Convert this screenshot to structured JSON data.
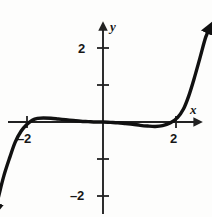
{
  "chart_data": {
    "type": "line",
    "title": "",
    "xlabel": "x",
    "ylabel": "y",
    "xlim": [
      -2.7,
      2.6
    ],
    "ylim": [
      -2.6,
      2.6
    ],
    "grid": false,
    "legend": null,
    "axis_labels": {
      "x": "x",
      "y": "y"
    },
    "x_ticks": [
      {
        "value": -2,
        "label": "–2"
      },
      {
        "value": 2,
        "label": "2"
      }
    ],
    "y_ticks": [
      {
        "value": 2,
        "label": "2"
      },
      {
        "value": -2,
        "label": "–2"
      }
    ],
    "unlabeled_x_ticks": [],
    "unlabeled_y_ticks": [
      1,
      -1
    ],
    "series": [
      {
        "name": "curve",
        "color": "#111111",
        "arrow_start": "down",
        "arrow_end": "up",
        "description": "odd-degree polynomial with local maximum near x=-0.9, flat inflection at origin, local minimum near x=0.7",
        "x": [
          -1.45,
          -1.4,
          -1.33,
          -1.25,
          -1.18,
          -1.1,
          -1.02,
          -0.95,
          -0.88,
          -0.8,
          -0.7,
          -0.6,
          -0.5,
          -0.4,
          -0.3,
          -0.2,
          -0.1,
          0.0,
          0.1,
          0.2,
          0.3,
          0.4,
          0.5,
          0.6,
          0.7,
          0.8,
          0.9,
          1.0,
          1.08,
          1.15,
          1.22,
          1.3,
          1.38,
          1.45
        ],
        "y": [
          -2.42,
          -2.0,
          -1.45,
          -0.95,
          -0.55,
          -0.25,
          -0.06,
          0.05,
          0.1,
          0.11,
          0.1,
          0.08,
          0.06,
          0.04,
          0.02,
          0.01,
          0.0,
          0.0,
          -0.01,
          -0.02,
          -0.04,
          -0.06,
          -0.09,
          -0.11,
          -0.12,
          -0.1,
          -0.03,
          0.12,
          0.35,
          0.7,
          1.15,
          1.72,
          2.3,
          2.6
        ]
      }
    ],
    "key_points": {
      "local_max": {
        "x": -0.8,
        "y": 0.11
      },
      "inflection": {
        "x": 0.0,
        "y": 0.0
      },
      "local_min": {
        "x": 0.7,
        "y": -0.12
      }
    },
    "colors": {
      "curve": "#111111",
      "axis": "#222222",
      "text": "#171717",
      "background": "#fdfdfc"
    }
  }
}
